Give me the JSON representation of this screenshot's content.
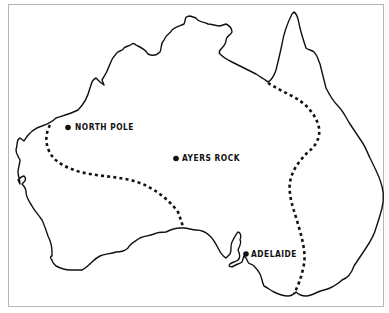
{
  "map": {
    "region": "Australia",
    "colors": {
      "background": "#ffffff",
      "ink": "#111111",
      "frame": "#b5b5b5"
    },
    "cities": [
      {
        "name": "NORTH POLE",
        "dot": [
          68,
          127
        ],
        "label_pos": [
          74,
          123
        ]
      },
      {
        "name": "AYERS ROCK",
        "dot": [
          176,
          158
        ],
        "label_pos": [
          182,
          154
        ]
      },
      {
        "name": "ADELAIDE",
        "dot": [
          246,
          253
        ],
        "label_pos": [
          251,
          249
        ]
      }
    ],
    "boundary_style": "dashed"
  }
}
